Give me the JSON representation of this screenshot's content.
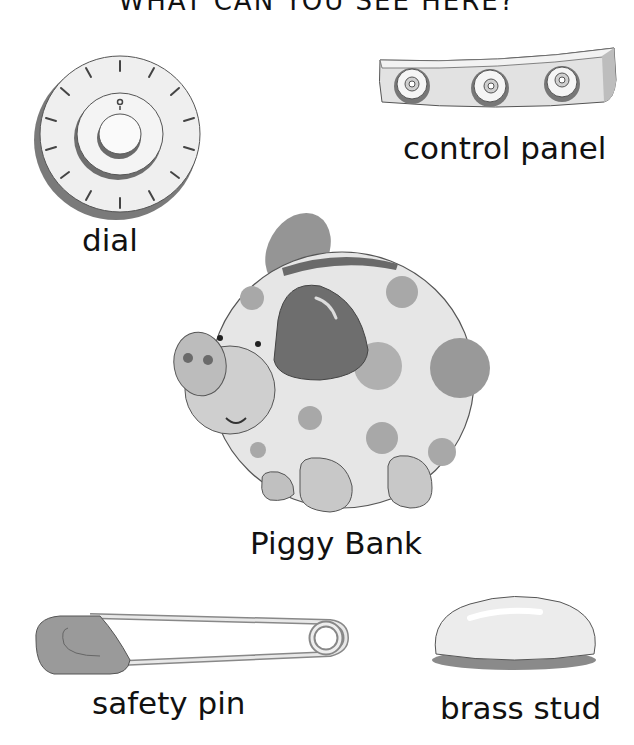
{
  "page": {
    "title": "WHAT CAN YOU SEE HERE?"
  },
  "items": [
    {
      "id": "dial",
      "label": "dial"
    },
    {
      "id": "control-panel",
      "label": "control panel"
    },
    {
      "id": "piggy-bank",
      "label": "Piggy Bank"
    },
    {
      "id": "safety-pin",
      "label": "safety pin"
    },
    {
      "id": "brass-stud",
      "label": "brass stud"
    }
  ],
  "colors": {
    "background": "#ffffff",
    "outline": "#444444",
    "light_gray": "#e4e4e4",
    "mid_gray": "#a9a9a9",
    "dark_gray": "#6e6e6e"
  }
}
